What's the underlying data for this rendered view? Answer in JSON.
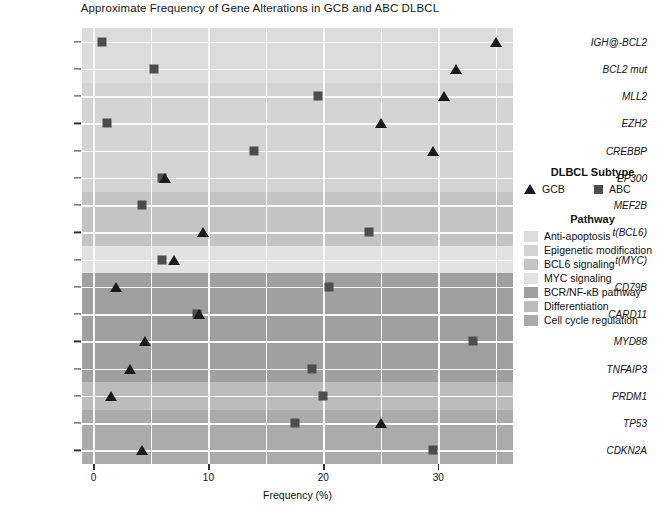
{
  "chart_data": {
    "type": "scatter",
    "title": "Approximate Frequency of Gene Alterations in GCB and ABC DLBCL",
    "xlabel": "Frequency (%)",
    "ylabel": "",
    "xlim": [
      -1,
      36.5
    ],
    "xticks": [
      0,
      10,
      20,
      30
    ],
    "xtick_labels": [
      "0",
      "10",
      "20",
      "30"
    ],
    "grid": true,
    "legend_position": "right",
    "categories": [
      "IGH@-BCL2",
      "BCL2 mut",
      "MLL2",
      "EZH2",
      "CREBBP",
      "EP300",
      "MEF2B",
      "t(BCL6)",
      "t(MYC)",
      "CD79B",
      "CARD11",
      "MYD88",
      "TNFAIP3",
      "PRDM1",
      "TP53",
      "CDKN2A"
    ],
    "series": [
      {
        "name": "GCB",
        "marker": "triangle",
        "color": "#1a1a1a",
        "values": [
          35.0,
          31.5,
          30.5,
          25.0,
          29.5,
          6.2,
          null,
          9.5,
          7.0,
          2.0,
          9.2,
          4.5,
          3.2,
          1.5,
          25.0,
          4.2
        ]
      },
      {
        "name": "ABC",
        "marker": "square",
        "color": "#4d4d4d",
        "values": [
          0.7,
          5.3,
          19.5,
          1.2,
          14.0,
          6.0,
          4.2,
          24.0,
          6.0,
          20.5,
          9.0,
          33.0,
          19.0,
          20.0,
          17.5,
          29.5
        ]
      }
    ],
    "row_pathways": [
      "Anti-apoptosis",
      "Anti-apoptosis",
      "Epigenetic modification",
      "Epigenetic modification",
      "Epigenetic modification",
      "Epigenetic modification",
      "BCL6 signaling",
      "BCL6 signaling",
      "MYC signaling",
      "BCR/NF-κB pathway",
      "BCR/NF-κB pathway",
      "BCR/NF-κB pathway",
      "BCR/NF-κB pathway",
      "Differentiation",
      "Cell cycle regulation",
      "Cell cycle regulation"
    ]
  },
  "legend": {
    "subtype_title": "DLBCL Subtype",
    "subtypes": [
      {
        "label": "GCB",
        "marker": "triangle",
        "color": "#1a1a1a"
      },
      {
        "label": "ABC",
        "marker": "square",
        "color": "#4d4d4d"
      }
    ],
    "pathway_title": "Pathway",
    "pathways": [
      {
        "label": "Anti-apoptosis",
        "color": "#dcdcdc"
      },
      {
        "label": "Epigenetic modification",
        "color": "#d4d4d4"
      },
      {
        "label": "BCL6 signaling",
        "color": "#c4c4c4"
      },
      {
        "label": "MYC signaling",
        "color": "#e2e2e2"
      },
      {
        "label": "BCR/NF-κB pathway",
        "color": "#a0a0a0"
      },
      {
        "label": "Differentiation",
        "color": "#bcbcbc"
      },
      {
        "label": "Cell cycle regulation",
        "color": "#ababab"
      }
    ]
  }
}
